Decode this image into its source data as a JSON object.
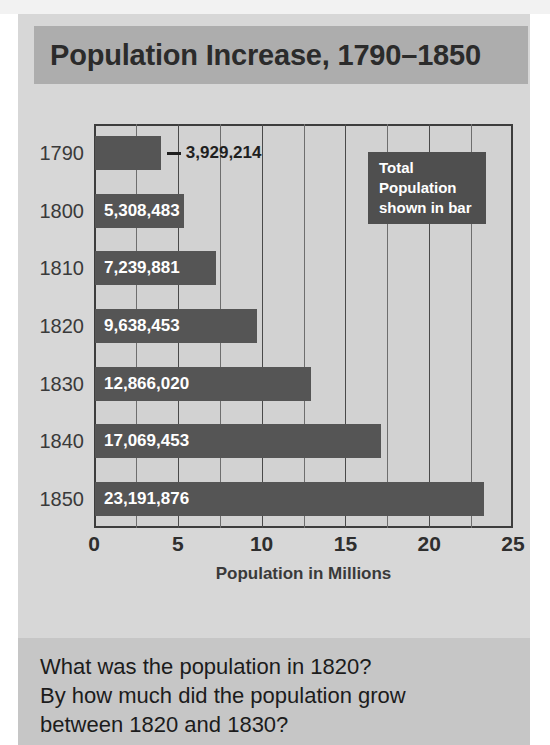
{
  "title": "Population Increase, 1790–1850",
  "legend": {
    "lines": [
      "Total",
      "Population",
      "shown in bar"
    ]
  },
  "axis": {
    "xlabel": "Population in Millions",
    "ticks": [
      "0",
      "5",
      "10",
      "15",
      "20",
      "25"
    ],
    "tick_values": [
      0,
      5,
      10,
      15,
      20,
      25
    ],
    "minor_step": 2.5
  },
  "questions": [
    "What was the population in 1820?",
    "By how much did the population grow",
    "between 1820 and 1830?"
  ],
  "colors": {
    "page_panel": "#d7d7d7",
    "title_banner": "#adadad",
    "bar": "#555555",
    "legend_box": "#4f4f4f",
    "question_band": "#c6c6c6",
    "plot_background": "#d2d2d2",
    "frame": "#3d3d3d"
  },
  "chart_data": {
    "type": "bar",
    "orientation": "horizontal",
    "title": "Population Increase, 1790–1850",
    "xlabel": "Population in Millions",
    "ylabel": "",
    "xlim": [
      0,
      25
    ],
    "grid": true,
    "legend": "Total Population shown in bar",
    "legend_position": "upper-right-inside",
    "categories": [
      "1790",
      "1800",
      "1810",
      "1820",
      "1830",
      "1840",
      "1850"
    ],
    "values": [
      3.929214,
      5.308483,
      7.239881,
      9.638453,
      12.86602,
      17.069453,
      23.191876
    ],
    "data_labels": [
      "3,929,214",
      "5,308,483",
      "7,239,881",
      "9,638,453",
      "12,866,020",
      "17,069,453",
      "23,191,876"
    ],
    "label_placement": [
      "outside",
      "inside",
      "inside",
      "inside",
      "inside",
      "inside",
      "inside"
    ],
    "units": "millions"
  }
}
